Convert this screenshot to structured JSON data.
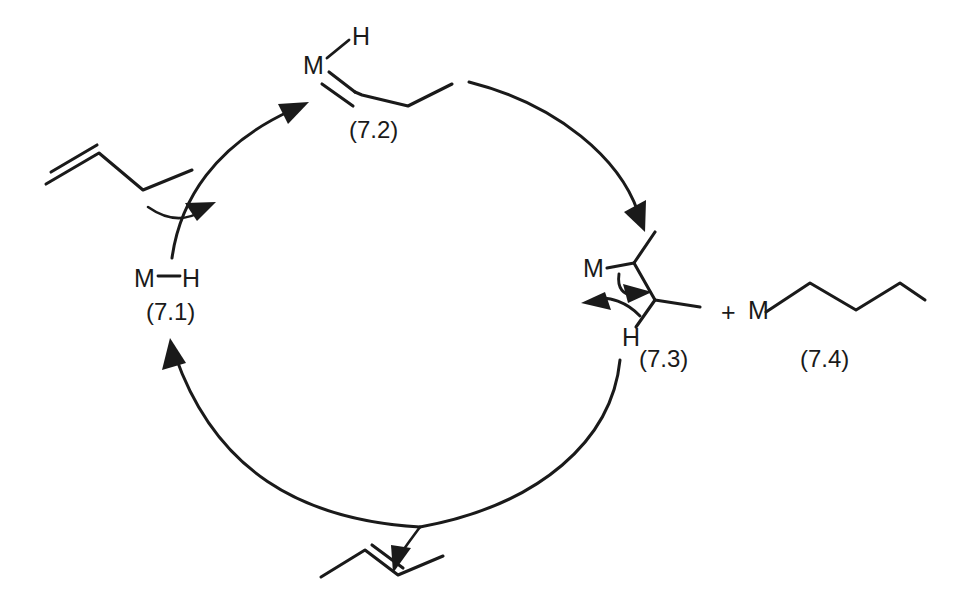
{
  "diagram": {
    "type": "catalytic-cycle",
    "background_color": "#ffffff",
    "line_color": "#1a1a1a"
  },
  "species": {
    "catalyst": {
      "id": "7.1",
      "label": "(7.1)",
      "atom_metal": "M",
      "atom_hydride": "H",
      "formula_text": "M—H",
      "role": "metal hydride catalyst"
    },
    "alkene_complex": {
      "id": "7.2",
      "label": "(7.2)",
      "atom_metal": "M",
      "atom_hydride": "H",
      "role": "metal hydride alkene complex"
    },
    "insertion_intermediate": {
      "id": "7.3",
      "label": "(7.3)",
      "atom_metal": "M",
      "atom_hydride": "H",
      "role": "secondary alkyl metal intermediate with beta-hydride elimination arrows"
    },
    "alkyl_product": {
      "id": "7.4",
      "label": "(7.4)",
      "atom_metal": "M",
      "plus_sign": "+",
      "role": "n-butyl metal species"
    },
    "substrate": {
      "label": "",
      "role": "1-butene entering the cycle"
    },
    "product": {
      "label": "",
      "role": "2-butene leaving the cycle"
    }
  },
  "labels": {
    "metal": "M",
    "hydride": "H",
    "plus": "+",
    "compound_7_1": "(7.1)",
    "compound_7_2": "(7.2)",
    "compound_7_3": "(7.3)",
    "compound_7_4": "(7.4)"
  }
}
